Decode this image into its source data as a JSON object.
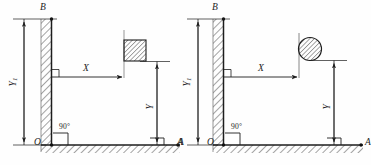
{
  "figure": {
    "panels": [
      {
        "id": "left",
        "body_shape": "square-block",
        "labels": {
          "wall_top": "B",
          "origin": "O",
          "ground_end": "A",
          "vertical_wall_dim": "Y",
          "vertical_wall_dim_sub": "1",
          "horizontal_dim": "X",
          "vertical_dim": "Y",
          "corner_angle": "90°"
        }
      },
      {
        "id": "right",
        "body_shape": "circle",
        "labels": {
          "wall_top": "B",
          "origin": "O",
          "ground_start": "A",
          "ground_end": "A",
          "vertical_wall_dim": "Y",
          "vertical_wall_dim_sub": "1",
          "horizontal_dim": "X",
          "vertical_dim": "Y",
          "corner_angle": "90°"
        }
      }
    ],
    "colors": {
      "line": "#1d1d1d",
      "hatch": "#555555",
      "fill": "#ffffff",
      "background": "#fefefe"
    }
  }
}
